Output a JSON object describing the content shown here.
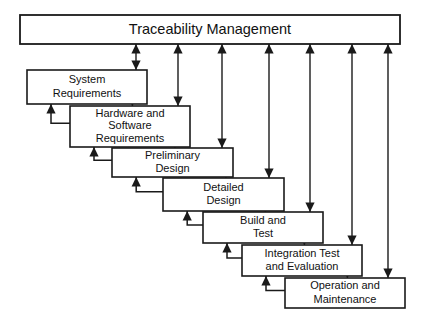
{
  "diagram": {
    "title": "Traceability Management",
    "type": "waterfall-lifecycle-model",
    "background_color": "#ffffff",
    "line_color": "#1a1a1a",
    "box_fill": "#ffffff",
    "top_bar": {
      "label": "Traceability Management",
      "x": 20,
      "y": 15,
      "width": 380,
      "height": 29
    },
    "phases": [
      {
        "id": "system-requirements",
        "lines": [
          "System",
          "Requirements"
        ],
        "x": 27,
        "y": 70,
        "width": 120,
        "height": 34,
        "trace_x": 136,
        "trace_double_headed": true
      },
      {
        "id": "hardware-and-software-requirements",
        "lines": [
          "Hardware and",
          "Software",
          "Requirements"
        ],
        "x": 70,
        "y": 106,
        "width": 120,
        "height": 41,
        "trace_x": 178,
        "trace_double_headed": true
      },
      {
        "id": "preliminary-design",
        "lines": [
          "Preliminary",
          "Design"
        ],
        "x": 112,
        "y": 148,
        "width": 121,
        "height": 29,
        "trace_x": 222,
        "trace_double_headed": true
      },
      {
        "id": "detailed-design",
        "lines": [
          "Detailed",
          "Design"
        ],
        "x": 163,
        "y": 178,
        "width": 121,
        "height": 33,
        "trace_x": 269,
        "trace_double_headed": false
      },
      {
        "id": "build-and-test",
        "lines": [
          "Build and",
          "Test"
        ],
        "x": 203,
        "y": 212,
        "width": 120,
        "height": 31,
        "trace_x": 310,
        "trace_double_headed": false
      },
      {
        "id": "integration-test-and-evaluation",
        "lines": [
          "Integration Test",
          "and Evaluation"
        ],
        "x": 242,
        "y": 245,
        "width": 120,
        "height": 31,
        "trace_x": 352,
        "trace_double_headed": false
      },
      {
        "id": "operation-and-maintenance",
        "lines": [
          "Operation and",
          "Maintenance"
        ],
        "x": 285,
        "y": 278,
        "width": 120,
        "height": 30,
        "trace_x": 388,
        "trace_double_headed": false
      }
    ],
    "flow": {
      "forward_label": "cascade-down-to-next-phase",
      "feedback_label": "feedback-up-to-previous-phase"
    }
  }
}
